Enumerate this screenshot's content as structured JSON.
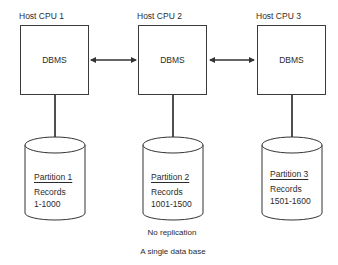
{
  "diagram": {
    "hosts": [
      {
        "label": "Host CPU 1",
        "system": "DBMS"
      },
      {
        "label": "Host CPU 2",
        "system": "DBMS"
      },
      {
        "label": "Host CPU 3",
        "system": "DBMS"
      }
    ],
    "partitions": [
      {
        "title": "Partition 1",
        "records_label": "Records",
        "range": "1-1000"
      },
      {
        "title": "Partition 2",
        "records_label": "Records",
        "range": "1001-1500"
      },
      {
        "title": "Partition 3",
        "records_label": "Records",
        "range": "1501-1600"
      }
    ],
    "connections": [
      {
        "from": "Host CPU 1",
        "to": "Host CPU 2",
        "type": "bidirectional-arrow"
      },
      {
        "from": "Host CPU 2",
        "to": "Host CPU 3",
        "type": "bidirectional-arrow"
      }
    ],
    "captions": {
      "replication": "No replication",
      "database": "A single data base"
    },
    "colors": {
      "stroke": "#333333",
      "text": "#2b2b2b",
      "background": "#ffffff"
    }
  }
}
